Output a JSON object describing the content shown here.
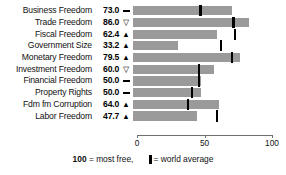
{
  "chart_data": {
    "type": "bar",
    "title": "",
    "xlabel": "",
    "ylabel": "",
    "xlim": [
      0,
      100
    ],
    "grid": false,
    "orientation": "horizontal",
    "categories": [
      "Business Freedom",
      "Trade Freedom",
      "Fiscal Freedom",
      "Government Size",
      "Monetary Freedom",
      "Investment Freedom",
      "Financial Freedom",
      "Property Rights",
      "Fdm fm Corruption",
      "Labor Freedom"
    ],
    "values": [
      73.0,
      86.0,
      62.4,
      33.2,
      79.5,
      60.0,
      50.0,
      50.0,
      64.0,
      47.7
    ],
    "value_labels": [
      "73.0",
      "86.0",
      "62.4",
      "33.2",
      "79.5",
      "60.0",
      "50.0",
      "50.0",
      "64.0",
      "47.7"
    ],
    "trend_symbols": [
      "flat",
      "down",
      "up",
      "up",
      "up",
      "down",
      "flat",
      "flat",
      "up",
      "up"
    ],
    "world_average": [
      50.0,
      74.5,
      75.5,
      65.0,
      73.4,
      49.0,
      49.0,
      44.0,
      40.5,
      62.0
    ],
    "axis_ticks": [
      0,
      50,
      100
    ],
    "axis_tick_labels": [
      "0",
      "50",
      "100"
    ],
    "series": [
      {
        "name": "Country score",
        "values": [
          73.0,
          86.0,
          62.4,
          33.2,
          79.5,
          60.0,
          50.0,
          50.0,
          64.0,
          47.7
        ]
      },
      {
        "name": "World average",
        "values": [
          50.0,
          74.5,
          75.5,
          65.0,
          73.4,
          49.0,
          49.0,
          44.0,
          40.5,
          62.0
        ]
      }
    ],
    "colors": {
      "bar": "#9a9a9a",
      "average_marker": "#000000",
      "axis": "#6f6f6f",
      "text": "#111111"
    }
  },
  "legend": {
    "max_value": "100",
    "most_free_text": "= most free,",
    "world_average_text": "= world average"
  }
}
